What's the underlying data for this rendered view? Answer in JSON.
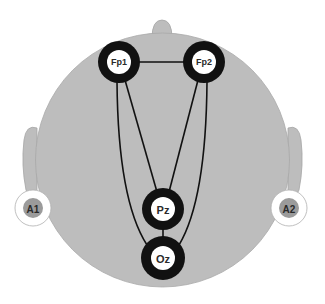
{
  "diagram": {
    "type": "eeg-electrode-montage",
    "colors": {
      "head_fill": "#bdbdbd",
      "head_stroke": "#9a9a9a",
      "electrode_ring": "#111111",
      "electrode_center": "#ffffff",
      "reference_ring": "#ffffff",
      "reference_center": "#9b9b9b",
      "connection": "#111111"
    },
    "electrodes": [
      {
        "id": "Fp1",
        "label": "Fp1"
      },
      {
        "id": "Fp2",
        "label": "Fp2"
      },
      {
        "id": "Pz",
        "label": "Pz"
      },
      {
        "id": "Oz",
        "label": "Oz"
      }
    ],
    "references": [
      {
        "id": "A1",
        "label": "A1"
      },
      {
        "id": "A2",
        "label": "A2"
      }
    ],
    "connections": [
      [
        "Fp1",
        "Fp2"
      ],
      [
        "Fp1",
        "Pz"
      ],
      [
        "Fp1",
        "Oz"
      ],
      [
        "Fp2",
        "Pz"
      ],
      [
        "Fp2",
        "Oz"
      ],
      [
        "Pz",
        "Oz"
      ]
    ]
  }
}
